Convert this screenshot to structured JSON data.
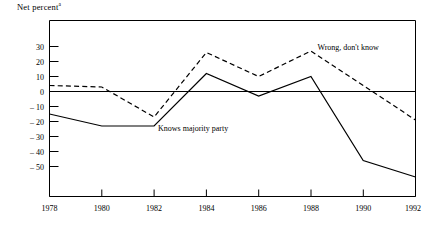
{
  "chart_data": {
    "type": "line",
    "title": "",
    "ylabel": "Net percent",
    "ylabel_superscript": "a",
    "xlabel": "",
    "x": [
      1978,
      1980,
      1982,
      1984,
      1986,
      1988,
      1990,
      1992
    ],
    "xtick_labels": [
      "1978",
      "1980",
      "1982",
      "1984",
      "1986",
      "1988",
      "1990",
      "1992"
    ],
    "ytick_labels": [
      "30",
      "20",
      "10",
      "0",
      "– 10",
      "– 20",
      "– 30",
      "– 40",
      "– 50"
    ],
    "yticks": [
      30,
      20,
      10,
      0,
      -10,
      -20,
      -30,
      -40,
      -50
    ],
    "ylim": [
      -60,
      38
    ],
    "xlim": [
      1978,
      1992
    ],
    "grid": false,
    "legend": "annotations-on-plot",
    "zero_line": 0,
    "series": [
      {
        "name": "Knows majority party",
        "style": "solid",
        "values": [
          -15,
          -23,
          -23,
          12,
          -3,
          10,
          -46,
          -57
        ],
        "label": "Knows majority party",
        "label_x": 1982.15,
        "label_y": -26
      },
      {
        "name": "Wrong, don't know",
        "style": "dashed",
        "values": [
          4,
          3,
          -17,
          26,
          10,
          27,
          4,
          -19
        ],
        "label": "Wrong, don't know",
        "label_x": 1988.25,
        "label_y": 28
      }
    ]
  },
  "colors": {
    "axis": "#000000",
    "series_solid": "#000000",
    "series_dashed": "#000000",
    "background": "#ffffff"
  }
}
